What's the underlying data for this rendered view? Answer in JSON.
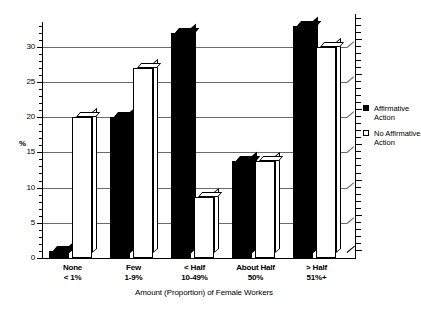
{
  "chart_data": {
    "type": "bar",
    "title": "",
    "xlabel": "Amount (Proportion) of Female Workers",
    "ylabel": "%",
    "ylim": [
      0,
      33.5
    ],
    "yticks": [
      0,
      5,
      10,
      15,
      20,
      25,
      30
    ],
    "grid": true,
    "legend_position": "right",
    "categories": [
      "None\n< 1%",
      "Few\n1-9%",
      "< Half\n10-49%",
      "About Half\n50%",
      "> Half\n51%+"
    ],
    "category_lines": [
      [
        "None",
        "< 1%"
      ],
      [
        "Few",
        "1-9%"
      ],
      [
        "< Half",
        "10-49%"
      ],
      [
        "About Half",
        "50%"
      ],
      [
        "> Half",
        "51%+"
      ]
    ],
    "series": [
      {
        "name": "Affirmative Action",
        "color": "#000000",
        "values": [
          1.0,
          20.0,
          32.0,
          13.7,
          33.0
        ]
      },
      {
        "name": "No Affirmative Action",
        "color": "#ffffff",
        "values": [
          20.0,
          27.0,
          8.6,
          13.7,
          30.0
        ]
      }
    ]
  },
  "axis": {
    "y_title": "%",
    "x_title": "Amount (Proportion) of Female Workers",
    "tick_labels": [
      "0",
      "5",
      "10",
      "15",
      "20",
      "25",
      "30"
    ]
  },
  "legend": {
    "items": [
      {
        "swatch": "filled-square-icon",
        "line1": "Affirmative",
        "line2": "Action"
      },
      {
        "swatch": "open-square-icon",
        "line1": "No Affirmative",
        "line2": "Action"
      }
    ]
  }
}
